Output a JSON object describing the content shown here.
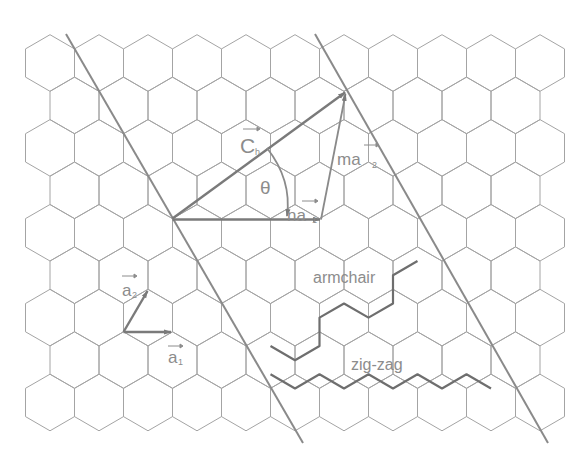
{
  "diagram": {
    "title": "",
    "labels": {
      "chiral_vector": "C",
      "chiral_sub": "h",
      "theta": "θ",
      "n_a1": "na",
      "n_a1_sub": "1",
      "m_a2": "ma",
      "m_a2_sub": "2",
      "a1": "a",
      "a1_sub": "1",
      "a2": "a",
      "a2_sub": "2",
      "armchair": "armchair",
      "zigzag": "zig-zag"
    },
    "colors": {
      "lattice": "#a4a4a4",
      "vectors": "#7a7a7a",
      "text": "#8c8c8c",
      "background": "#ffffff"
    },
    "lattice": {
      "type": "hexagonal honeycomb",
      "rows": 9,
      "hex_width": 49,
      "origin_x": 50,
      "origin_y": 63
    },
    "geometry": {
      "a_origin": [
        123.5,
        331.7
      ],
      "a1_tip": [
        172.5,
        331.7
      ],
      "a2_tip": [
        148,
        289.3
      ],
      "ch_origin": [
        172.5,
        218.5
      ],
      "na1_tip": [
        321,
        218.5
      ],
      "ch_tip": [
        346,
        91.6
      ],
      "left_boundary": [
        [
          66,
          34
        ],
        [
          303,
          443
        ]
      ],
      "right_boundary": [
        [
          315,
          34
        ],
        [
          548,
          443
        ]
      ]
    }
  }
}
